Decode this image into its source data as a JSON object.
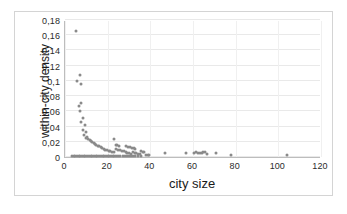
{
  "chart_data": {
    "type": "scatter",
    "title": "",
    "xlabel": "city size",
    "ylabel": "within-city density",
    "xlim": [
      0,
      120
    ],
    "ylim": [
      0,
      0.18
    ],
    "grid": true,
    "legend": false,
    "marker_color": "#8a8a8a",
    "x_ticks": [
      "0",
      "20",
      "40",
      "60",
      "80",
      "100",
      "120"
    ],
    "x_tick_values": [
      0,
      20,
      40,
      60,
      80,
      100,
      120
    ],
    "y_ticks": [
      "0",
      "0,02",
      "0,04",
      "0,06",
      "0,08",
      "0,1",
      "0,12",
      "0,14",
      "0,16",
      "0,18"
    ],
    "y_tick_values": [
      0,
      0.02,
      0.04,
      0.06,
      0.08,
      0.1,
      0.12,
      0.14,
      0.16,
      0.18
    ],
    "decimal_separator": ",",
    "points": [
      [
        5.0,
        0.165
      ],
      [
        5.6,
        0.1005
      ],
      [
        7.2,
        0.1075
      ],
      [
        7.4,
        0.0955
      ],
      [
        6.6,
        0.0665
      ],
      [
        7.6,
        0.0715
      ],
      [
        6.9,
        0.0605
      ],
      [
        8.6,
        0.051
      ],
      [
        7.5,
        0.046
      ],
      [
        9.2,
        0.042
      ],
      [
        8.3,
        0.035
      ],
      [
        9.8,
        0.033
      ],
      [
        9.0,
        0.0295
      ],
      [
        10.4,
        0.0265
      ],
      [
        10.0,
        0.025
      ],
      [
        11.0,
        0.0235
      ],
      [
        11.6,
        0.0225
      ],
      [
        12.2,
        0.021
      ],
      [
        12.8,
        0.0196
      ],
      [
        13.4,
        0.0185
      ],
      [
        14.0,
        0.0172
      ],
      [
        14.6,
        0.016
      ],
      [
        15.3,
        0.015
      ],
      [
        16.0,
        0.014
      ],
      [
        16.7,
        0.0128
      ],
      [
        17.4,
        0.0118
      ],
      [
        18.2,
        0.0108
      ],
      [
        18.9,
        0.0098
      ],
      [
        19.6,
        0.009
      ],
      [
        20.4,
        0.0082
      ],
      [
        21.2,
        0.0074
      ],
      [
        22.0,
        0.0066
      ],
      [
        22.8,
        0.006
      ],
      [
        23.1,
        0.0235
      ],
      [
        23.8,
        0.016
      ],
      [
        24.6,
        0.0152
      ],
      [
        25.4,
        0.0145
      ],
      [
        24.0,
        0.0105
      ],
      [
        25.0,
        0.0098
      ],
      [
        26.0,
        0.009
      ],
      [
        26.8,
        0.0082
      ],
      [
        27.6,
        0.0074
      ],
      [
        28.4,
        0.0066
      ],
      [
        29.2,
        0.0058
      ],
      [
        30.0,
        0.005
      ],
      [
        30.8,
        0.0044
      ],
      [
        28.5,
        0.014
      ],
      [
        29.5,
        0.0135
      ],
      [
        30.5,
        0.0126
      ],
      [
        31.4,
        0.012
      ],
      [
        32.2,
        0.0112
      ],
      [
        33.0,
        0.0104
      ],
      [
        31.8,
        0.0062
      ],
      [
        32.6,
        0.0056
      ],
      [
        33.4,
        0.0048
      ],
      [
        34.2,
        0.0042
      ],
      [
        35.0,
        0.0036
      ],
      [
        35.6,
        0.0074
      ],
      [
        36.4,
        0.007
      ],
      [
        37.2,
        0.0064
      ],
      [
        38.0,
        0.003
      ],
      [
        38.8,
        0.0026
      ],
      [
        39.6,
        0.0022
      ],
      [
        46.8,
        0.0055
      ],
      [
        56.5,
        0.0052
      ],
      [
        60.5,
        0.0048
      ],
      [
        61.6,
        0.0062
      ],
      [
        62.4,
        0.0058
      ],
      [
        63.2,
        0.0054
      ],
      [
        64.0,
        0.005
      ],
      [
        64.8,
        0.0068
      ],
      [
        65.6,
        0.0062
      ],
      [
        66.5,
        0.0044
      ],
      [
        70.6,
        0.0058
      ],
      [
        77.8,
        0.0022
      ],
      [
        104.0,
        0.0028
      ],
      [
        3.2,
        0.0008
      ],
      [
        4.0,
        0.0008
      ],
      [
        4.8,
        0.0008
      ],
      [
        5.6,
        0.0008
      ],
      [
        6.4,
        0.0008
      ],
      [
        7.2,
        0.0008
      ],
      [
        8.0,
        0.0008
      ],
      [
        8.8,
        0.0008
      ],
      [
        9.6,
        0.0008
      ],
      [
        10.4,
        0.0008
      ],
      [
        11.2,
        0.0008
      ],
      [
        12.0,
        0.0008
      ],
      [
        12.8,
        0.0008
      ],
      [
        13.6,
        0.0008
      ],
      [
        14.4,
        0.0008
      ],
      [
        15.2,
        0.0008
      ],
      [
        16.0,
        0.0008
      ],
      [
        16.8,
        0.0008
      ],
      [
        17.6,
        0.0008
      ],
      [
        18.4,
        0.0008
      ],
      [
        19.2,
        0.0008
      ],
      [
        20.0,
        0.0008
      ],
      [
        20.8,
        0.0008
      ],
      [
        21.6,
        0.0008
      ],
      [
        22.4,
        0.0008
      ],
      [
        23.2,
        0.0008
      ],
      [
        24.0,
        0.0008
      ],
      [
        25.0,
        0.0008
      ],
      [
        26.0,
        0.0008
      ],
      [
        27.0,
        0.0008
      ],
      [
        28.0,
        0.0008
      ],
      [
        29.0,
        0.0008
      ],
      [
        30.0,
        0.0008
      ],
      [
        31.0,
        0.0008
      ],
      [
        32.0,
        0.0008
      ],
      [
        33.0,
        0.0008
      ],
      [
        34.2,
        0.0008
      ],
      [
        35.4,
        0.0008
      ]
    ]
  }
}
